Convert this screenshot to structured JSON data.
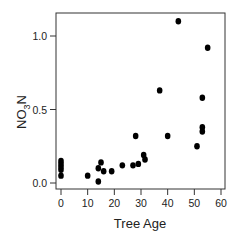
{
  "chart_data": {
    "type": "scatter",
    "title": "",
    "xlabel": "Tree Age",
    "ylabel": "NO3N",
    "ylabel_parts": {
      "base": "NO",
      "sub": "3",
      "tail": "N"
    },
    "xlim": [
      0,
      60
    ],
    "ylim": [
      0.0,
      1.1
    ],
    "xticks": [
      0,
      10,
      20,
      30,
      40,
      50,
      60
    ],
    "xtick_labels": [
      "0",
      "10",
      "20",
      "30",
      "40",
      "50",
      "60"
    ],
    "yticks": [
      0.0,
      0.5,
      1.0
    ],
    "ytick_labels": [
      "0.0",
      "0.5",
      "1.0"
    ],
    "grid": false,
    "legend": null,
    "marker_color": "#000000",
    "points": [
      {
        "x": 0,
        "y": 0.15
      },
      {
        "x": 0,
        "y": 0.13
      },
      {
        "x": 0,
        "y": 0.11
      },
      {
        "x": 0,
        "y": 0.09
      },
      {
        "x": 0,
        "y": 0.05
      },
      {
        "x": 10,
        "y": 0.05
      },
      {
        "x": 14,
        "y": 0.1
      },
      {
        "x": 14,
        "y": 0.01
      },
      {
        "x": 15,
        "y": 0.14
      },
      {
        "x": 16,
        "y": 0.08
      },
      {
        "x": 19,
        "y": 0.08
      },
      {
        "x": 23,
        "y": 0.12
      },
      {
        "x": 27,
        "y": 0.12
      },
      {
        "x": 28,
        "y": 0.32
      },
      {
        "x": 29,
        "y": 0.13
      },
      {
        "x": 31,
        "y": 0.19
      },
      {
        "x": 31.5,
        "y": 0.16
      },
      {
        "x": 37,
        "y": 0.63
      },
      {
        "x": 40,
        "y": 0.32
      },
      {
        "x": 44,
        "y": 1.1
      },
      {
        "x": 51,
        "y": 0.25
      },
      {
        "x": 53,
        "y": 0.58
      },
      {
        "x": 53,
        "y": 0.38
      },
      {
        "x": 53,
        "y": 0.35
      },
      {
        "x": 55,
        "y": 0.92
      }
    ]
  }
}
